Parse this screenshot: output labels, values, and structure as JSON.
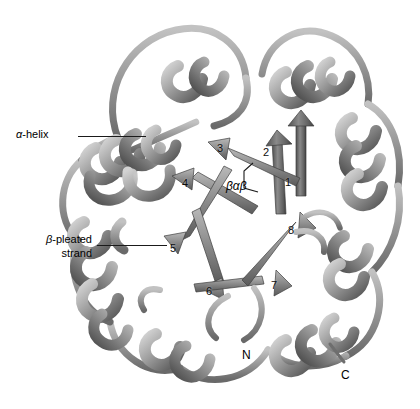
{
  "figure": {
    "type": "protein-ribbon-diagram",
    "structure_name": "TIM barrel (beta/alpha barrel)",
    "background_color": "#ffffff",
    "render_style": "grayscale ribbon cartoon",
    "palette": {
      "ribbon_light": "#c9c9c9",
      "ribbon_mid": "#9a9a9a",
      "ribbon_dark": "#5d5d5d",
      "ribbon_shadow": "#3f3f3f",
      "outline": "#4a4a4a",
      "label_color": "#000000",
      "leader_line_color": "#1a1a1a"
    }
  },
  "annotations": {
    "alpha_helix": {
      "symbol": "α",
      "rest": "-helix",
      "x": 16,
      "y": 128,
      "leader": {
        "x": 78,
        "y": 136,
        "length": 68
      }
    },
    "beta_strand": {
      "symbol": "β",
      "rest": "-pleated",
      "line2": "strand",
      "x": 8,
      "y": 233,
      "leader": {
        "x": 97,
        "y": 245,
        "length": 70
      }
    },
    "bab_motif": {
      "label": "βαβ",
      "x": 226,
      "y": 179
    }
  },
  "strand_labels": [
    {
      "number": "1",
      "x": 285,
      "y": 176
    },
    {
      "number": "2",
      "x": 263,
      "y": 146
    },
    {
      "number": "3",
      "x": 217,
      "y": 142
    },
    {
      "number": "4",
      "x": 182,
      "y": 177
    },
    {
      "number": "5",
      "x": 170,
      "y": 242
    },
    {
      "number": "6",
      "x": 206,
      "y": 285
    },
    {
      "number": "7",
      "x": 271,
      "y": 279
    },
    {
      "number": "8",
      "x": 288,
      "y": 224
    }
  ],
  "termini": [
    {
      "label": "N",
      "x": 242,
      "y": 348
    },
    {
      "label": "C",
      "x": 341,
      "y": 368
    }
  ]
}
